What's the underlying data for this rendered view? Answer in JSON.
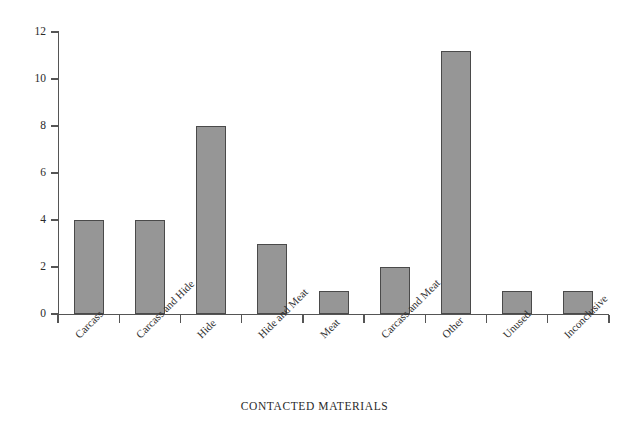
{
  "chart_data": {
    "type": "bar",
    "title": "",
    "xlabel": "CONTACTED MATERIALS",
    "ylabel": "NUMBER",
    "categories": [
      "Carcass",
      "Carcass and Hide",
      "Hide",
      "Hide and Meat",
      "Meat",
      "Carcass and Meat",
      "Other",
      "Unused",
      "Inconclusive"
    ],
    "values": [
      4,
      4,
      8,
      3,
      1,
      2,
      11.2,
      1,
      1
    ],
    "ylim": [
      0,
      12
    ],
    "yticks": [
      0,
      2,
      4,
      6,
      8,
      10,
      12
    ],
    "ytick_labels": [
      "0",
      "2",
      "4",
      "6",
      "8",
      "10",
      "12"
    ],
    "grid": false,
    "legend": false,
    "bar_color": "#969696",
    "bar_edge_color": "#4a4a4a",
    "axis_color": "#555555",
    "background": "#ffffff",
    "xtick_label_rotation": 45
  }
}
